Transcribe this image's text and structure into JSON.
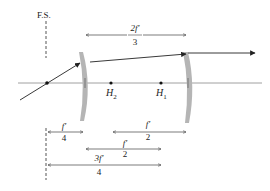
{
  "diagram": {
    "field_stop_label": "F.S.",
    "principal_points": {
      "h2": {
        "main": "H",
        "sub": "2"
      },
      "h1": {
        "main": "H",
        "sub": "1"
      }
    },
    "dimensions": {
      "top": {
        "num": "2f′",
        "den": "3"
      },
      "fs_to_lens1": {
        "num": "f′",
        "den": "4"
      },
      "h2_to_right": {
        "num": "f′",
        "den": "2"
      },
      "mid": {
        "num": "f′",
        "den": "2"
      },
      "fs_to_h": {
        "num": "3f′",
        "den": "4"
      }
    },
    "colors": {
      "lens": "#b5b5b5",
      "line": "#333333",
      "axis": "#888888"
    }
  }
}
